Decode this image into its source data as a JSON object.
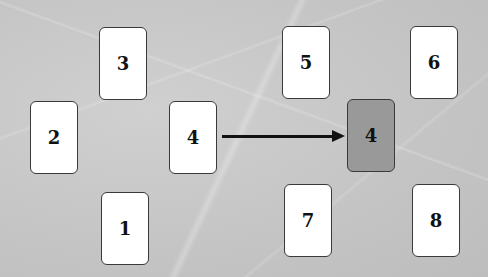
{
  "diagram": {
    "cards": [
      {
        "id": "card-3",
        "label": "3",
        "left": 99,
        "top": 27,
        "highlighted": false
      },
      {
        "id": "card-2",
        "label": "2",
        "left": 30,
        "top": 101,
        "highlighted": false
      },
      {
        "id": "card-4-source",
        "label": "4",
        "left": 169,
        "top": 101,
        "highlighted": false
      },
      {
        "id": "card-1",
        "label": "1",
        "left": 101,
        "top": 192,
        "highlighted": false
      },
      {
        "id": "card-5",
        "label": "5",
        "left": 282,
        "top": 26,
        "highlighted": false
      },
      {
        "id": "card-6",
        "label": "6",
        "left": 410,
        "top": 26,
        "highlighted": false
      },
      {
        "id": "card-4-target",
        "label": "4",
        "left": 347,
        "top": 99,
        "highlighted": true
      },
      {
        "id": "card-7",
        "label": "7",
        "left": 284,
        "top": 184,
        "highlighted": false
      },
      {
        "id": "card-8",
        "label": "8",
        "left": 412,
        "top": 184,
        "highlighted": false
      }
    ],
    "arrow": {
      "from": "card-4-source",
      "to": "card-4-target"
    },
    "colors": {
      "background": "#c9c9c9",
      "card": "#ffffff",
      "card_highlight": "#999999",
      "border": "#3a3a3a",
      "arrow": "#111111"
    }
  }
}
